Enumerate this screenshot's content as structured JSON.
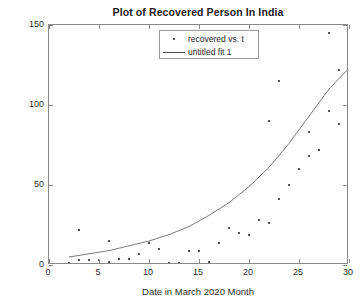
{
  "chart_data": {
    "type": "scatter",
    "title": "Plot of Recovered Person In India",
    "xlabel": "Date in March 2020 Month",
    "ylabel": "Recovered Person in India",
    "xlim": [
      0,
      30
    ],
    "ylim": [
      0,
      150
    ],
    "xticks": [
      0,
      5,
      10,
      15,
      20,
      25,
      30
    ],
    "yticks": [
      0,
      50,
      100,
      150
    ],
    "grid": false,
    "legend_position": "top-center",
    "legend": [
      {
        "label": "recovered vs. t",
        "marker": "dot"
      },
      {
        "label": "untitled fit 1",
        "marker": "line"
      }
    ],
    "series": [
      {
        "name": "recovered vs. t",
        "type": "scatter",
        "points": [
          {
            "x": 2,
            "y": 1
          },
          {
            "x": 3,
            "y": 3
          },
          {
            "x": 3,
            "y": 22
          },
          {
            "x": 4,
            "y": 3
          },
          {
            "x": 5,
            "y": 3
          },
          {
            "x": 6,
            "y": 2
          },
          {
            "x": 6,
            "y": 15
          },
          {
            "x": 7,
            "y": 4
          },
          {
            "x": 8,
            "y": 4
          },
          {
            "x": 9,
            "y": 7
          },
          {
            "x": 10,
            "y": 14
          },
          {
            "x": 11,
            "y": 10
          },
          {
            "x": 12,
            "y": 1
          },
          {
            "x": 13,
            "y": 1
          },
          {
            "x": 14,
            "y": 9
          },
          {
            "x": 15,
            "y": 9
          },
          {
            "x": 16,
            "y": 2
          },
          {
            "x": 17,
            "y": 14
          },
          {
            "x": 18,
            "y": 23
          },
          {
            "x": 19,
            "y": 20
          },
          {
            "x": 20,
            "y": 19
          },
          {
            "x": 21,
            "y": 28
          },
          {
            "x": 22,
            "y": 26
          },
          {
            "x": 22,
            "y": 90
          },
          {
            "x": 23,
            "y": 41
          },
          {
            "x": 23,
            "y": 115
          },
          {
            "x": 24,
            "y": 50
          },
          {
            "x": 25,
            "y": 60
          },
          {
            "x": 26,
            "y": 68
          },
          {
            "x": 26,
            "y": 83
          },
          {
            "x": 27,
            "y": 72
          },
          {
            "x": 28,
            "y": 96
          },
          {
            "x": 28,
            "y": 145
          },
          {
            "x": 29,
            "y": 88
          },
          {
            "x": 29,
            "y": 122
          },
          {
            "x": 30,
            "y": 130
          }
        ]
      },
      {
        "name": "untitled fit 1",
        "type": "line",
        "description": "exponential fit curve",
        "points": [
          {
            "x": 2,
            "y": 5
          },
          {
            "x": 4,
            "y": 7
          },
          {
            "x": 6,
            "y": 9
          },
          {
            "x": 8,
            "y": 12
          },
          {
            "x": 10,
            "y": 15
          },
          {
            "x": 12,
            "y": 19
          },
          {
            "x": 14,
            "y": 24
          },
          {
            "x": 16,
            "y": 31
          },
          {
            "x": 18,
            "y": 39
          },
          {
            "x": 20,
            "y": 49
          },
          {
            "x": 22,
            "y": 61
          },
          {
            "x": 24,
            "y": 76
          },
          {
            "x": 26,
            "y": 93
          },
          {
            "x": 28,
            "y": 110
          },
          {
            "x": 30,
            "y": 123
          }
        ]
      }
    ]
  }
}
